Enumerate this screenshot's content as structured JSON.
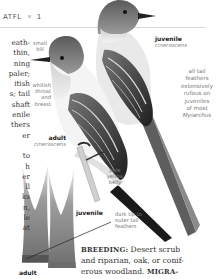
{
  "header": {
    "code": "ATFL",
    "number": "1"
  },
  "body_column_fragments": [
    "eath-",
    "thin,",
    "ning",
    "paler;",
    "itish",
    "s; tail",
    "shaft",
    "enile",
    "thers",
    "er",
    "",
    "to",
    "h",
    "er",
    "ll",
    "ks",
    "n,",
    "le",
    "at"
  ],
  "labels": {
    "small_bill": [
      "small",
      "bill"
    ],
    "whitish_throat": [
      "whitish",
      "throat",
      "and",
      "breast"
    ],
    "adult_bird": {
      "title": "adult",
      "subtitle": "cinerascens"
    },
    "juvenile_bird": {
      "title": "juvenile",
      "subtitle": "cinerascens"
    },
    "tail_note": [
      "all tail",
      "feathers",
      "extensively",
      "rufous on",
      "juveniles",
      "of most",
      "Myiarchus"
    ],
    "pale_belly": [
      "pale",
      "yellow",
      "belly"
    ],
    "juvenile_feather": "juvenile",
    "adult_feather": "adult",
    "dark_tip": [
      "dark tip to",
      "outer tail",
      "feathers"
    ]
  },
  "text": {
    "breeding_label": "BREEDING:",
    "breeding_line1": " Desert scrub",
    "breeding_line2": "and riparian, oak, or conif-",
    "breeding_line3_pre": "erous woodland. ",
    "migration_label": "MIGRA-"
  },
  "colors": {
    "ink": "#333333",
    "label_gray": "#777777",
    "rule": "#d8d8d8"
  }
}
